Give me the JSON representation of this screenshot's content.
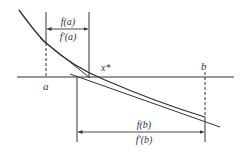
{
  "diagram": {
    "labels": {
      "a": "a",
      "b": "b",
      "root": "x*",
      "frac_a_num": "f(a)",
      "frac_a_den": "f′(a)",
      "frac_b_num": "f(b)",
      "frac_b_den": "f′(b)"
    },
    "colors": {
      "line": "#333333",
      "background": "#ffffff"
    }
  }
}
